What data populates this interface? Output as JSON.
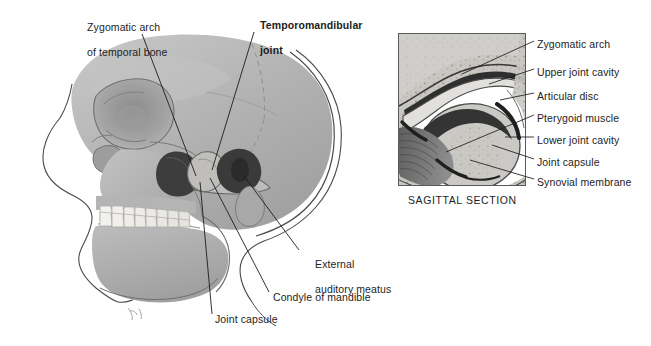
{
  "figure": {
    "background_color": "#ffffff",
    "ink_color": "#1d1d1d",
    "bone_color": "#b0b0b0",
    "bone_light_color": "#c9c9c9",
    "bone_dark_color": "#8f8f8f",
    "tooth_color": "#f2f1ee",
    "cavity_color": "#3a3a3a",
    "muscle_color": "#6e6e6e"
  },
  "left_panel": {
    "name": "lateral-skull-view",
    "labels": [
      {
        "id": "zygomatic-arch-temporal",
        "line1": "Zygomatic arch",
        "line2": "of temporal bone",
        "bold": false,
        "x": 75,
        "y": 8
      },
      {
        "id": "temporomandibular-joint",
        "line1": "Temporomandibular",
        "line2": "joint",
        "bold": true,
        "x": 248,
        "y": 6
      },
      {
        "id": "external-auditory-meatus",
        "line1": "External",
        "line2": "auditory meatus",
        "bold": false,
        "x": 303,
        "y": 245
      },
      {
        "id": "condyle-of-mandible",
        "line1": "Condyle of mandible",
        "line2": "",
        "bold": false,
        "x": 273,
        "y": 291
      },
      {
        "id": "joint-capsule-left",
        "line1": "Joint capsule",
        "line2": "",
        "bold": false,
        "x": 215,
        "y": 313
      }
    ]
  },
  "right_panel": {
    "name": "sagittal-section-view",
    "caption": "SAGITTAL SECTION",
    "caption_x": 408,
    "caption_y": 194,
    "frame": {
      "x": 398,
      "y": 33,
      "width": 128,
      "height": 153
    },
    "labels": [
      {
        "id": "zygomatic-arch",
        "text": "Zygomatic arch",
        "x": 537,
        "y": 38
      },
      {
        "id": "upper-joint-cavity",
        "text": "Upper joint cavity",
        "x": 537,
        "y": 66
      },
      {
        "id": "articular-disc",
        "text": "Articular disc",
        "x": 537,
        "y": 90
      },
      {
        "id": "pterygoid-muscle",
        "text": "Pterygoid muscle",
        "x": 537,
        "y": 112
      },
      {
        "id": "lower-joint-cavity",
        "text": "Lower joint cavity",
        "x": 537,
        "y": 134
      },
      {
        "id": "joint-capsule",
        "text": "Joint capsule",
        "x": 537,
        "y": 156
      },
      {
        "id": "synovial-membrane",
        "text": "Synovial membrane",
        "x": 537,
        "y": 176
      }
    ]
  }
}
